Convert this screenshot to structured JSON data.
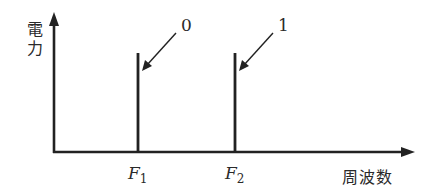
{
  "diagram": {
    "type": "frequency-spectrum",
    "y_axis_label_line1": "電",
    "y_axis_label_line2": "力",
    "x_axis_label": "周波数",
    "lines": [
      {
        "freq_label": "F",
        "freq_sub": "1",
        "symbol": "0"
      },
      {
        "freq_label": "F",
        "freq_sub": "2",
        "symbol": "1"
      }
    ],
    "colors": {
      "stroke": "#222222",
      "text": "#2a2a2a",
      "background": "#ffffff"
    }
  }
}
